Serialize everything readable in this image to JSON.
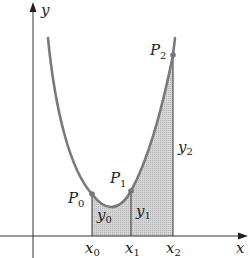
{
  "diagram": {
    "axes": {
      "x_label": "x",
      "y_label": "y"
    },
    "points": [
      {
        "name": "P",
        "sub": "0"
      },
      {
        "name": "P",
        "sub": "1"
      },
      {
        "name": "P",
        "sub": "2"
      }
    ],
    "x_ticks": [
      {
        "name": "x",
        "sub": "0"
      },
      {
        "name": "x",
        "sub": "1"
      },
      {
        "name": "x",
        "sub": "2"
      }
    ],
    "ordinates": [
      {
        "name": "y",
        "sub": "0"
      },
      {
        "name": "y",
        "sub": "1"
      },
      {
        "name": "y",
        "sub": "2"
      }
    ],
    "colors": {
      "curve": "#7a7a7a",
      "shade": "#c8c8c8",
      "axis": "#333333"
    }
  }
}
